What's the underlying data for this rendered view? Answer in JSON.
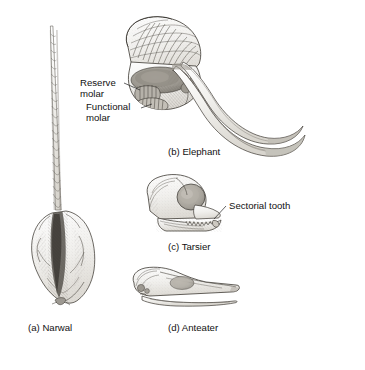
{
  "figure": {
    "background_color": "#ffffff",
    "ink_color": "#1a1a1a",
    "panels": [
      {
        "id": "a",
        "caption": "(a) Narwal",
        "subject": "narwhal-skull-with-spiral-tusk",
        "view": "dorsal"
      },
      {
        "id": "b",
        "caption": "(b) Elephant",
        "subject": "elephant-skull-sagittal-section-with-tusks",
        "view": "lateral-section"
      },
      {
        "id": "c",
        "caption": "(c) Tarsier",
        "subject": "tarsier-skull",
        "view": "lateral"
      },
      {
        "id": "d",
        "caption": "(d) Anteater",
        "subject": "anteater-skull",
        "view": "lateral"
      }
    ],
    "annotations": [
      {
        "id": "reserve-molar",
        "line1": "Reserve",
        "line2": "molar",
        "panel": "b"
      },
      {
        "id": "functional-molar",
        "line1": "Functional",
        "line2": "molar",
        "panel": "b"
      },
      {
        "id": "sectorial-tooth",
        "line1": "Sectorial tooth",
        "line2": "",
        "panel": "c"
      }
    ]
  }
}
